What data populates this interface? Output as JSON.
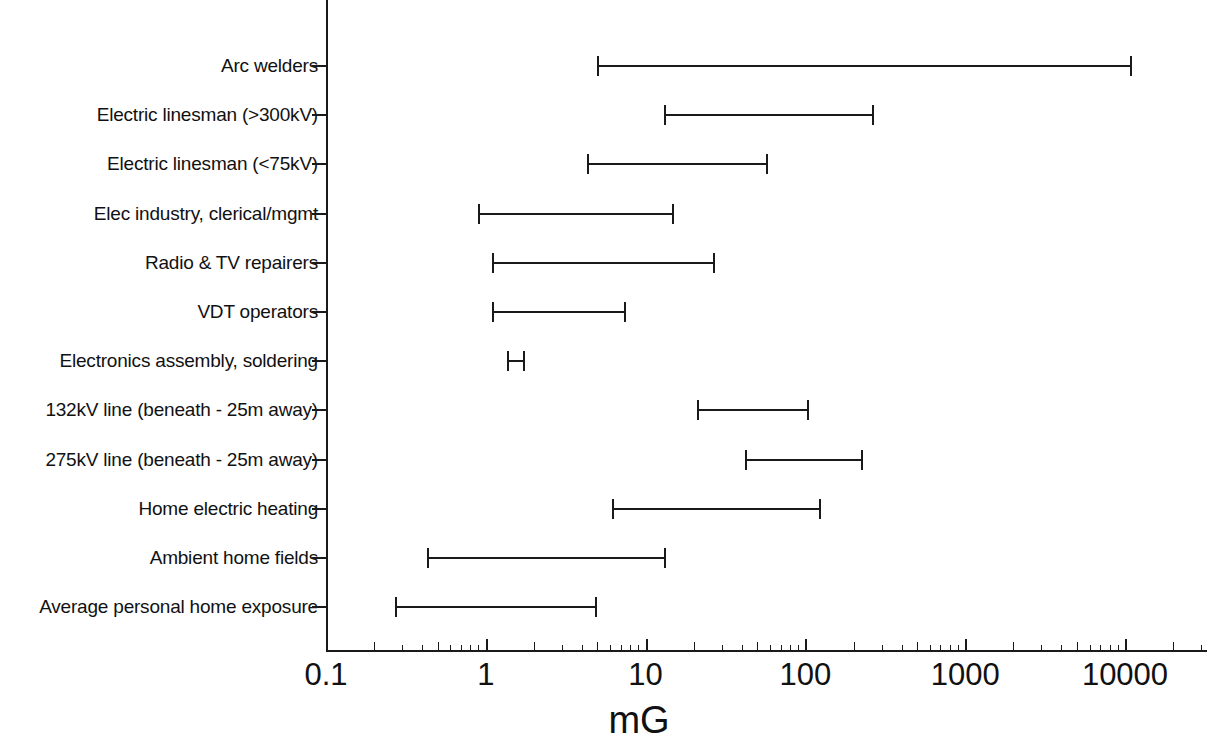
{
  "chart_data": {
    "type": "bar",
    "subtype": "horizontal-range",
    "title": "",
    "xlabel": "mG",
    "ylabel": "",
    "xscale": "log",
    "xlim": [
      0.1,
      30000
    ],
    "grid": false,
    "legend": null,
    "xticklabels": [
      "0.1",
      "1",
      "10",
      "100",
      "1000",
      "10000"
    ],
    "xtickvalues": [
      0.1,
      1,
      10,
      100,
      1000,
      10000
    ],
    "categories": [
      "Arc welders",
      "Electric linesman (>300kV)",
      "Electric linesman (<75kV)",
      "Elec industry, clerical/mgmt",
      "Radio & TV repairers",
      "VDT operators",
      "Electronics assembly, soldering",
      "132kV line (beneath - 25m away)",
      "275kV line (beneath - 25m away)",
      "Home electric heating",
      "Ambient home fields",
      "Average personal home exposure"
    ],
    "ranges": [
      {
        "label": "Arc welders",
        "low": 5.0,
        "high": 11000
      },
      {
        "label": "Electric linesman (>300kV)",
        "low": 13,
        "high": 270
      },
      {
        "label": "Electric linesman (<75kV)",
        "low": 4.3,
        "high": 58
      },
      {
        "label": "Elec industry, clerical/mgmt",
        "low": 0.9,
        "high": 15
      },
      {
        "label": "Radio & TV repairers",
        "low": 1.1,
        "high": 27
      },
      {
        "label": "VDT operators",
        "low": 1.1,
        "high": 7.5
      },
      {
        "label": "Electronics assembly, soldering",
        "low": 1.35,
        "high": 1.75
      },
      {
        "label": "132kV line (beneath - 25m away)",
        "low": 21,
        "high": 105
      },
      {
        "label": "275kV line (beneath - 25m away)",
        "low": 42,
        "high": 230
      },
      {
        "label": "Home electric heating",
        "low": 6.2,
        "high": 125
      },
      {
        "label": "Ambient home fields",
        "low": 0.43,
        "high": 13.5
      },
      {
        "label": "Average personal home exposure",
        "low": 0.27,
        "high": 5.0
      }
    ]
  }
}
